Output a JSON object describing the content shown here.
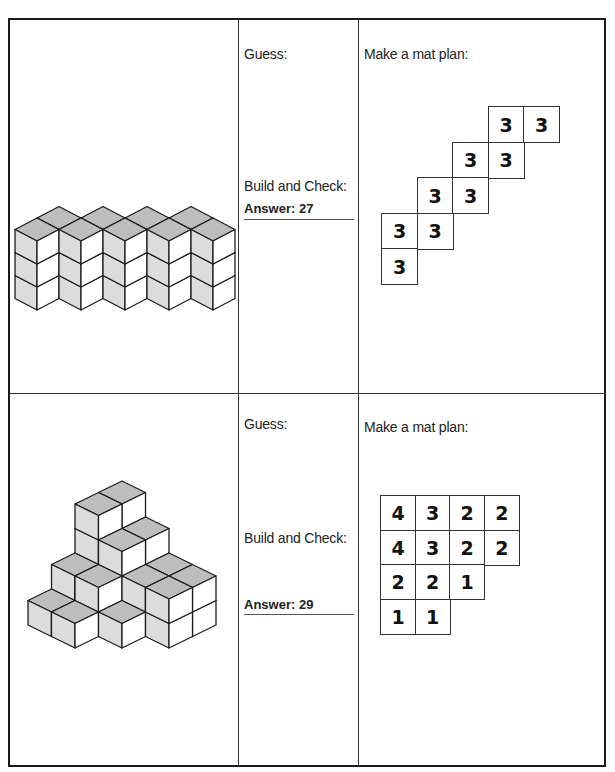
{
  "problems": [
    {
      "guess_label": "Guess:",
      "build_label": "Build and Check:",
      "answer_label": "Answer: 27",
      "mat_label": "Make a mat plan:",
      "mat_plan": {
        "rows": [
          [
            null,
            null,
            null,
            3,
            3
          ],
          [
            null,
            null,
            3,
            3,
            null
          ],
          [
            null,
            3,
            3,
            null,
            null
          ],
          [
            3,
            3,
            null,
            null,
            null
          ],
          [
            3,
            null,
            null,
            null,
            null
          ]
        ]
      }
    },
    {
      "guess_label": "Guess:",
      "build_label": "Build and Check:",
      "answer_label": "Answer: 29",
      "mat_label": "Make a mat plan:",
      "mat_plan": {
        "rows": [
          [
            4,
            3,
            2,
            2
          ],
          [
            4,
            3,
            2,
            2
          ],
          [
            2,
            2,
            1,
            null
          ],
          [
            1,
            1,
            null,
            null
          ]
        ]
      }
    }
  ],
  "colors": {
    "top_face": "#bdbdbd",
    "left_face": "#dcdcdc",
    "right_face": "#ffffff",
    "edge": "#1e1e1e"
  }
}
